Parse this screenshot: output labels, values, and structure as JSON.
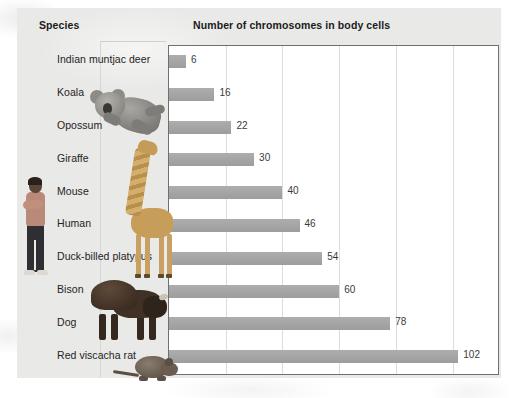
{
  "chart_data": {
    "type": "bar",
    "orientation": "horizontal",
    "title": "",
    "column_headers": [
      "Species",
      "Number of chromosomes in body cells"
    ],
    "xlabel": "Number of chromosomes in body cells",
    "ylabel": "Species",
    "categories": [
      "Indian muntjac deer",
      "Koala",
      "Opossum",
      "Giraffe",
      "Mouse",
      "Human",
      "Duck-billed platypus",
      "Bison",
      "Dog",
      "Red viscacha rat"
    ],
    "values": [
      6,
      16,
      22,
      30,
      40,
      46,
      54,
      60,
      78,
      102
    ],
    "data_labels": [
      "6",
      "16",
      "22",
      "30",
      "40",
      "46",
      "54",
      "60",
      "78",
      "102"
    ],
    "xlim": [
      0,
      116
    ],
    "gridlines_at": [
      20,
      40,
      60,
      80,
      100
    ],
    "grid": true,
    "tick_labels_visible": false,
    "legend": null,
    "bar_color": "#a3a3a3",
    "plot_background": "#ffffff",
    "panel_background": "#e9e9e7"
  },
  "photos": [
    {
      "name": "human-photo",
      "label": "human"
    },
    {
      "name": "koala-photo",
      "label": "koala"
    },
    {
      "name": "giraffe-photo",
      "label": "giraffe"
    },
    {
      "name": "bison-photo",
      "label": "bison"
    },
    {
      "name": "viscacha-rat-photo",
      "label": "red viscacha rat"
    }
  ]
}
